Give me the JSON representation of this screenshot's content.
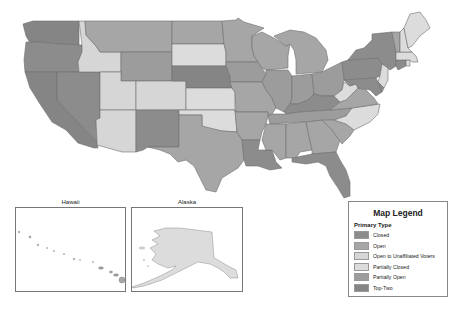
{
  "legend": {
    "title": "Map Legend",
    "subtitle": "Primary Type",
    "items": [
      {
        "label": "Closed",
        "color": "#8c8c8c"
      },
      {
        "label": "Open",
        "color": "#a6a6a6"
      },
      {
        "label": "Open to Unaffiliated Voters",
        "color": "#d6d6d6"
      },
      {
        "label": "Partially Closed",
        "color": "#dcdcdc"
      },
      {
        "label": "Partially Open",
        "color": "#9c9c9c"
      },
      {
        "label": "Top-Two",
        "color": "#858585"
      }
    ]
  },
  "insets": {
    "hawaii": {
      "title": "Hawaii"
    },
    "alaska": {
      "title": "Alaska"
    }
  },
  "states": {
    "WA": "Top-Two",
    "OR": "Closed",
    "CA": "Top-Two",
    "NV": "Closed",
    "ID": "Open to Unaffiliated Voters",
    "MT": "Open",
    "WY": "Partially Open",
    "UT": "Open to Unaffiliated Voters",
    "AZ": "Open to Unaffiliated Voters",
    "CO": "Open to Unaffiliated Voters",
    "NM": "Closed",
    "ND": "Open",
    "SD": "Partially Closed",
    "NE": "Top-Two",
    "KS": "Partially Closed",
    "OK": "Partially Closed",
    "TX": "Open",
    "MN": "Open",
    "IA": "Partially Open",
    "MO": "Open",
    "AR": "Open",
    "LA": "Closed",
    "WI": "Open",
    "IL": "Partially Open",
    "MI": "Open",
    "IN": "Partially Open",
    "OH": "Partially Open",
    "KY": "Closed",
    "TN": "Partially Open",
    "MS": "Open",
    "AL": "Open",
    "GA": "Open",
    "FL": "Closed",
    "SC": "Open",
    "NC": "Partially Closed",
    "VA": "Open",
    "WV": "Partially Closed",
    "PA": "Closed",
    "NY": "Closed",
    "NJ": "Partially Closed",
    "DE": "Closed",
    "MD": "Closed",
    "CT": "Closed",
    "RI": "Partially Closed",
    "MA": "Partially Closed",
    "VT": "Open",
    "NH": "Partially Closed",
    "ME": "Partially Closed",
    "AK": "Partially Closed",
    "HI": "Open"
  }
}
